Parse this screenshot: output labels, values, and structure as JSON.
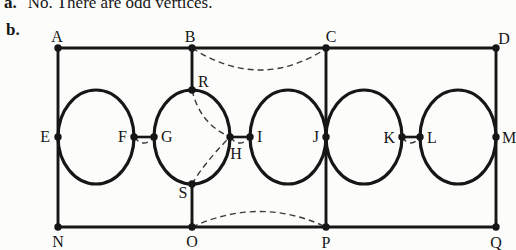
{
  "colors": {
    "ink": "#161616",
    "paper": "#fcfcfb"
  },
  "answer_a": {
    "marker": "a.",
    "text": "No. There are odd vertices."
  },
  "answer_b": {
    "marker": "b."
  },
  "graph": {
    "vertices": {
      "A": "A",
      "B": "B",
      "C": "C",
      "D": "D",
      "E": "E",
      "F": "F",
      "G": "G",
      "H": "H",
      "I": "I",
      "J": "J",
      "K": "K",
      "L": "L",
      "M": "M",
      "N": "N",
      "O": "O",
      "P": "P",
      "Q": "Q",
      "R": "R",
      "S": "S"
    },
    "solid_edges": [
      "A-B",
      "B-C",
      "C-D",
      "N-O",
      "O-P",
      "P-Q",
      "A-E",
      "E-N",
      "B-R",
      "S-O",
      "C-J",
      "J-P",
      "D-M",
      "M-Q",
      "F-G",
      "H-I",
      "K-L",
      "E-F upper arc",
      "E-F lower arc",
      "G-R arc",
      "R-H arc",
      "H-S arc",
      "S-G arc",
      "I-J upper arc",
      "I-J lower arc",
      "J-K upper arc",
      "J-K lower arc",
      "L-M upper arc",
      "L-M lower arc"
    ],
    "dashed_added_edges": [
      "B-C",
      "O-P",
      "F-G",
      "H-I",
      "K-L",
      "R-H",
      "S-H"
    ]
  }
}
